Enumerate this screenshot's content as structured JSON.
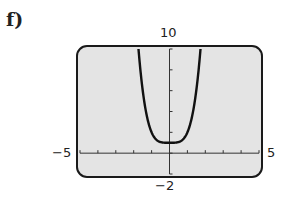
{
  "part_label": "f)",
  "chart_data": {
    "type": "line",
    "title": "",
    "function": "y = x^4 + 1",
    "xlabel": "",
    "ylabel": "",
    "xlim": [
      -5,
      5
    ],
    "ylim": [
      -2,
      10
    ],
    "xscl": 1,
    "yscl": 2,
    "grid": false,
    "window_labels": {
      "xmin": "−5",
      "xmax": "5",
      "ymin": "−2",
      "ymax": "10"
    },
    "series": [
      {
        "name": "curve",
        "x": [
          -1.78,
          -1.5,
          -1.25,
          -1,
          -0.75,
          -0.5,
          -0.25,
          0,
          0.25,
          0.5,
          0.75,
          1,
          1.25,
          1.5,
          1.78
        ],
        "y": [
          11.0,
          6.06,
          3.44,
          2.0,
          1.32,
          1.06,
          1.0,
          1.0,
          1.0,
          1.06,
          1.32,
          2.0,
          3.44,
          6.06,
          11.0
        ]
      }
    ]
  },
  "colors": {
    "screen_bg": "#e4e4e4",
    "frame": "#1a1a1a",
    "curve": "#111111"
  }
}
